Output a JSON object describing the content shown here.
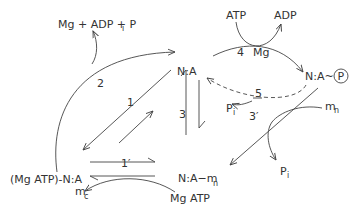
{
  "diagram": {
    "type": "reaction-scheme",
    "species": {
      "na": "N:A",
      "na_p": "N:A~",
      "phospho_symbol": "P",
      "mgatp_na": "(Mg ATP)-N:A",
      "na_mn": "N:A−m",
      "na_mn_sub": "n",
      "products_2_a": "Mg + ADP + P",
      "products_2_sub": "i",
      "atp": "ATP",
      "adp": "ADP",
      "mg": "Mg",
      "pi_5": "P",
      "pi_5_sub": "i",
      "pi_3p": "P",
      "pi_3p_sub": "i",
      "mn_in": "m",
      "mn_in_sub": "n",
      "mc": "m",
      "mc_sub": "c",
      "mgatp_in": "Mg ATP"
    },
    "steps": {
      "s1": "1",
      "s1p": "1′",
      "s2": "2",
      "s3": "3",
      "s3p": "3′",
      "s4": "4",
      "s5": "5"
    }
  }
}
